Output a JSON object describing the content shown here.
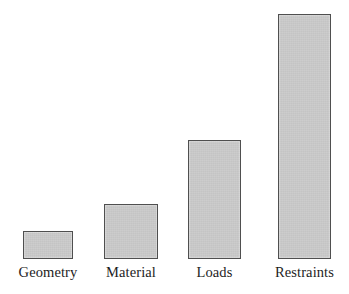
{
  "chart_data": {
    "type": "bar",
    "title": "",
    "subtitle": "",
    "xlabel": "",
    "ylabel": "",
    "categories": [
      "Geometry",
      "Material",
      "Loads",
      "Restraints"
    ],
    "values": [
      28,
      55,
      119,
      245
    ],
    "value_unit": "relative (pixel height)",
    "ylim": [
      0,
      250
    ],
    "grid": false,
    "legend": null,
    "annotations": [],
    "bars": [
      {
        "label": "Geometry",
        "value": 28,
        "x_left": 23,
        "width": 50,
        "top": 231,
        "baseline": 259
      },
      {
        "label": "Material",
        "value": 55,
        "x_left": 104,
        "width": 54,
        "top": 204,
        "baseline": 259
      },
      {
        "label": "Loads",
        "value": 119,
        "x_left": 188,
        "width": 53,
        "top": 140,
        "baseline": 259
      },
      {
        "label": "Restraints",
        "value": 245,
        "x_left": 278,
        "width": 53,
        "top": 14,
        "baseline": 259
      }
    ]
  },
  "style": {
    "bar_fill": "#cbcbcb",
    "bar_border": "#4f4f4f",
    "background": "#ffffff",
    "label_color": "#1d1d1d"
  }
}
